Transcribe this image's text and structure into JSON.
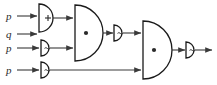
{
  "diagram": {
    "type": "logic-circuit-diagram",
    "width": 217,
    "height": 85,
    "colors": {
      "background": "#ffffff",
      "wire": "#3a3a3a",
      "gate_outline": "#1a1a1a",
      "symbol": "#2a2a2a"
    },
    "inputs": [
      {
        "id": "in1",
        "label": "p",
        "y": 16
      },
      {
        "id": "in2",
        "label": "q",
        "y": 34
      },
      {
        "id": "in3",
        "label": "p",
        "y": 48
      },
      {
        "id": "in4",
        "label": "p",
        "y": 70
      }
    ],
    "gates": [
      {
        "id": "g1",
        "kind": "or",
        "symbol": "+",
        "symbol_name": "plus-symbol",
        "label": "OR gate"
      },
      {
        "id": "g2",
        "kind": "and",
        "symbol": "•",
        "symbol_name": "dot-symbol",
        "label": "AND gate"
      },
      {
        "id": "g3",
        "kind": "not",
        "symbol": "~",
        "symbol_name": "tilde-symbol",
        "label": "NOT gate"
      },
      {
        "id": "g4",
        "kind": "not",
        "symbol": "~",
        "symbol_name": "tilde-symbol",
        "label": "NOT gate"
      },
      {
        "id": "g5",
        "kind": "not",
        "symbol": "~",
        "symbol_name": "tilde-symbol",
        "label": "NOT gate"
      },
      {
        "id": "g6",
        "kind": "and",
        "symbol": "•",
        "symbol_name": "dot-symbol",
        "label": "AND gate"
      },
      {
        "id": "g7",
        "kind": "not",
        "symbol": "~",
        "symbol_name": "tilde-symbol",
        "label": "NOT gate"
      }
    ],
    "output": {
      "id": "out1",
      "label": ""
    }
  }
}
